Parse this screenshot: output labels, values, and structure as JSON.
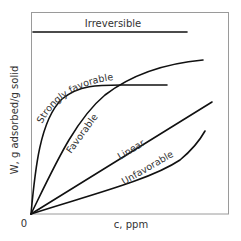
{
  "diagram": {
    "x_axis_label": "c, ppm",
    "y_axis_label": "W, g adsorbed/g solid",
    "origin_label": "0",
    "curves": [
      {
        "id": "irreversible",
        "label": "Irreversible"
      },
      {
        "id": "strongly-favorable",
        "label": "Strongly favorable"
      },
      {
        "id": "favorable",
        "label": "Favorable"
      },
      {
        "id": "linear",
        "label": "Linear"
      },
      {
        "id": "unfavorable",
        "label": "Unfavorable"
      }
    ],
    "colors": {
      "line": "#111111",
      "frame": "#9a9a9a",
      "text": "#333333"
    }
  }
}
